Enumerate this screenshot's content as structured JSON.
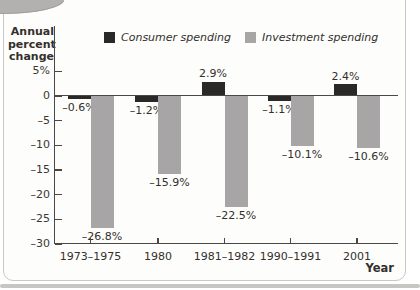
{
  "figure": {
    "y_axis_title": "Annual\npercent\nchange"
  },
  "chart_data": {
    "type": "bar",
    "title": "",
    "categories": [
      "1973–1975",
      "1980",
      "1981–1982",
      "1990–1991",
      "2001"
    ],
    "series": [
      {
        "name": "Consumer spending",
        "color": "#2b2828",
        "values": [
          -0.6,
          -1.2,
          2.9,
          -1.1,
          2.4
        ],
        "labels": [
          "–0.6%",
          "–1.2%",
          "2.9%",
          "–1.1%",
          "2.4%"
        ]
      },
      {
        "name": "Investment spending",
        "color": "#a7a5a5",
        "values": [
          -26.8,
          -15.9,
          -22.5,
          -10.1,
          -10.6
        ],
        "labels": [
          "–26.8%",
          "–15.9%",
          "–22.5%",
          "–10.1%",
          "–10.6%"
        ]
      }
    ],
    "xlabel": "Year",
    "ylabel": "Annual percent change",
    "ylim": [
      -30,
      5
    ],
    "yticks": [
      5,
      0,
      -5,
      -10,
      -15,
      -20,
      -25,
      -30
    ],
    "ytick_labels": [
      "5%",
      "0",
      "–5",
      "–10",
      "–15",
      "–20",
      "–25",
      "–30"
    ],
    "legend_position": "top",
    "grid": false,
    "axis_color": "#4a4745"
  }
}
